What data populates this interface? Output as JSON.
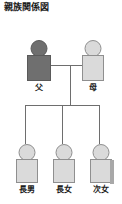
{
  "document": {
    "title": "親族関係図"
  },
  "diagram": {
    "type": "family-tree",
    "parents": [
      {
        "id": "father",
        "label": "父",
        "role": "father",
        "tone": "dark",
        "color": "#6f6f6f"
      },
      {
        "id": "mother",
        "label": "母",
        "role": "mother",
        "tone": "light",
        "color": "#dadada"
      }
    ],
    "children": [
      {
        "id": "child1",
        "label": "長男",
        "role": "eldest-son",
        "tone": "light",
        "color": "#dadada"
      },
      {
        "id": "child2",
        "label": "長女",
        "role": "eldest-daughter",
        "tone": "light",
        "color": "#dadada"
      },
      {
        "id": "child3",
        "label": "次女",
        "role": "second-daughter",
        "tone": "light",
        "color": "#dadada"
      }
    ],
    "line_color": "#6e6e6e",
    "background": "#ffffff",
    "text_color": "#1c1c1c"
  }
}
